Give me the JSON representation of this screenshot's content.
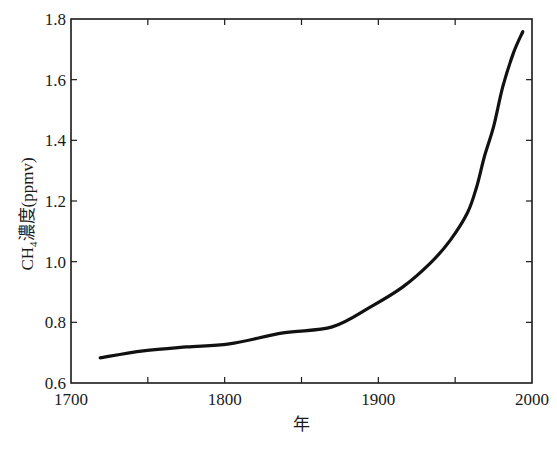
{
  "chart_data": {
    "type": "line",
    "title": "",
    "xlabel": "年",
    "ylabel": "CH₄濃度(ppmv)",
    "ylabel_parts": {
      "main": "CH",
      "sub": "4",
      "rest": "濃度(ppmv)"
    },
    "xlim": [
      1700,
      2000
    ],
    "ylim": [
      0.6,
      1.8
    ],
    "x_ticks": [
      1700,
      1800,
      1900,
      2000
    ],
    "x_tick_labels": [
      "1700",
      "1800",
      "1900",
      "2000"
    ],
    "x_minor_ticks": [
      1750,
      1850,
      1950
    ],
    "y_ticks": [
      0.6,
      0.8,
      1.0,
      1.2,
      1.4,
      1.6,
      1.8
    ],
    "y_tick_labels": [
      "0.6",
      "0.8",
      "1.0",
      "1.2",
      "1.4",
      "1.6",
      "1.8"
    ],
    "grid": false,
    "legend": null,
    "frame": "box",
    "series": [
      {
        "name": "CH4 concentration",
        "color": "#111111",
        "x": [
          1719,
          1747,
          1775,
          1803,
          1838,
          1870,
          1895,
          1916,
          1934,
          1947,
          1958,
          1964,
          1969,
          1975,
          1981,
          1988,
          1994
        ],
        "y": [
          0.683,
          0.706,
          0.719,
          0.729,
          0.765,
          0.785,
          0.851,
          0.917,
          0.996,
          1.072,
          1.161,
          1.247,
          1.346,
          1.445,
          1.577,
          1.689,
          1.758
        ]
      }
    ]
  }
}
